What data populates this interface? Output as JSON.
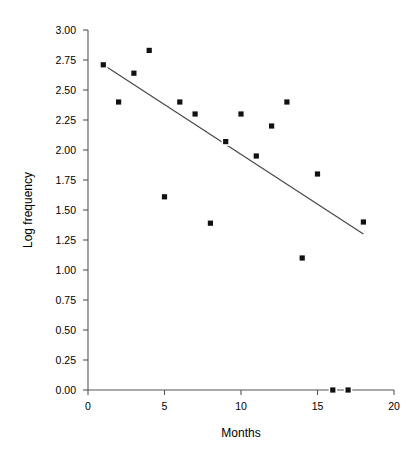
{
  "chart_data": {
    "type": "scatter",
    "title": "",
    "xlabel": "Months",
    "ylabel": "Log frequency",
    "xlim": [
      0,
      20
    ],
    "ylim": [
      0.0,
      3.0
    ],
    "grid": false,
    "legend": "none",
    "x_ticks": [
      "0",
      "5",
      "10",
      "15",
      "20"
    ],
    "x_tick_values": [
      0,
      5,
      10,
      15,
      20
    ],
    "y_ticks": [
      "0.00",
      "0.25",
      "0.50",
      "0.75",
      "1.00",
      "1.25",
      "1.50",
      "1.75",
      "2.00",
      "2.25",
      "2.50",
      "2.75",
      "3.00"
    ],
    "y_tick_values": [
      0.0,
      0.25,
      0.5,
      0.75,
      1.0,
      1.25,
      1.5,
      1.75,
      2.0,
      2.25,
      2.5,
      2.75,
      3.0
    ],
    "marker": "square",
    "marker_color": "#111111",
    "points": [
      {
        "x": 1,
        "y": 2.71
      },
      {
        "x": 2,
        "y": 2.4
      },
      {
        "x": 3,
        "y": 2.64
      },
      {
        "x": 4,
        "y": 2.83
      },
      {
        "x": 5,
        "y": 1.61
      },
      {
        "x": 6,
        "y": 2.4
      },
      {
        "x": 7,
        "y": 2.3
      },
      {
        "x": 8,
        "y": 1.39
      },
      {
        "x": 9,
        "y": 2.07
      },
      {
        "x": 10,
        "y": 2.3
      },
      {
        "x": 11,
        "y": 1.95
      },
      {
        "x": 12,
        "y": 2.2
      },
      {
        "x": 13,
        "y": 2.4
      },
      {
        "x": 14,
        "y": 1.1
      },
      {
        "x": 15,
        "y": 1.8
      },
      {
        "x": 16,
        "y": 0.0
      },
      {
        "x": 17,
        "y": 0.0
      },
      {
        "x": 18,
        "y": 1.4
      }
    ],
    "fit_line": {
      "name": "linear trend",
      "x_start": 1,
      "y_start": 2.71,
      "x_end": 18,
      "y_end": 1.3,
      "color": "#444444"
    }
  }
}
